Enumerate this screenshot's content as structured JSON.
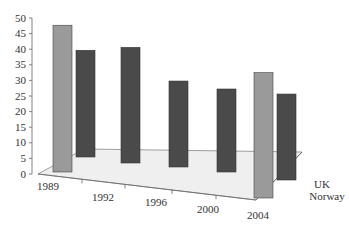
{
  "chart_data": {
    "type": "bar",
    "subtype": "3d-clustered-depth",
    "title": "",
    "xlabel": "",
    "ylabel": "",
    "ylim": [
      0,
      50
    ],
    "yticks": [
      "0",
      "5",
      "10",
      "15",
      "20",
      "25",
      "30",
      "35",
      "40",
      "45",
      "50"
    ],
    "categories": [
      "1989",
      "1992",
      "1996",
      "2000",
      "2004"
    ],
    "series": [
      {
        "name": "UK",
        "color": "#9a9a9a",
        "values": [
          48,
          null,
          null,
          null,
          41
        ]
      },
      {
        "name": "Norway",
        "color": "#4a4a4a",
        "values": [
          36,
          39,
          29,
          28,
          29
        ]
      }
    ],
    "legend": [
      "UK",
      "Norway"
    ],
    "legend_position": "right-depth-axis",
    "grid": false
  }
}
